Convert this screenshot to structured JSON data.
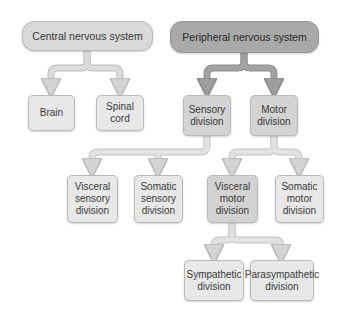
{
  "diagram": {
    "nodes": {
      "cns": "Central nervous system",
      "pns": "Peripheral nervous system",
      "brain": "Brain",
      "spinal_cord": "Spinal cord",
      "sensory": "Sensory division",
      "motor": "Motor division",
      "visceral_sensory": "Visceral sensory division",
      "somatic_sensory": "Somatic sensory division",
      "visceral_motor": "Visceral motor division",
      "somatic_motor": "Somatic motor division",
      "sympathetic": "Sympathetic division",
      "parasympathetic": "Parasympathetic division"
    },
    "edges": [
      [
        "cns",
        "brain"
      ],
      [
        "cns",
        "spinal_cord"
      ],
      [
        "pns",
        "sensory"
      ],
      [
        "pns",
        "motor"
      ],
      [
        "sensory",
        "visceral_sensory"
      ],
      [
        "sensory",
        "somatic_sensory"
      ],
      [
        "motor",
        "visceral_motor"
      ],
      [
        "motor",
        "somatic_motor"
      ],
      [
        "visceral_motor",
        "sympathetic"
      ],
      [
        "visceral_motor",
        "parasympathetic"
      ]
    ],
    "colors": {
      "cns_fill": "#d9d9d9",
      "pns_fill": "#a9a9a9",
      "mid_fill": "#d3d3d3",
      "leaf_fill": "#e8e8e8",
      "arrow_light": "#d4d4d4",
      "arrow_dark": "#9e9e9e"
    }
  }
}
